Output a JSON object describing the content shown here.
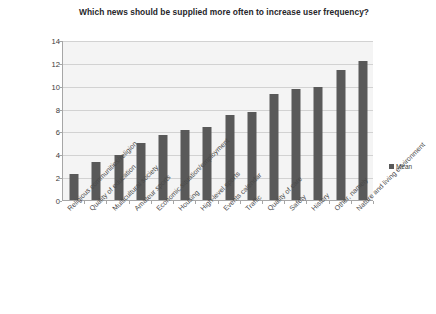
{
  "chart_data": {
    "type": "bar",
    "title": "Which news should be supplied more often to increase user frequency?",
    "xlabel": "",
    "ylabel": "",
    "ylim": [
      0,
      14
    ],
    "ytick_step": 2,
    "yticks": [
      0,
      2,
      4,
      6,
      8,
      10,
      12,
      14
    ],
    "grid": true,
    "legend_position": "right",
    "categories": [
      "Religious communities/religion",
      "Quality of education",
      "Multicultural society",
      "Amateur sports",
      "Economic situation/employment",
      "Housing",
      "High-level sports",
      "Events calendar",
      "Traffic",
      "Quality of care",
      "Safety",
      "History",
      "Other, namely",
      "Nature and living environment"
    ],
    "series": [
      {
        "name": "Mean",
        "color": "#595959",
        "values": [
          2.3,
          3.3,
          3.9,
          5.0,
          5.7,
          6.1,
          6.4,
          7.4,
          7.7,
          9.3,
          9.7,
          9.9,
          11.4,
          12.2
        ]
      }
    ]
  },
  "legend": {
    "entries": [
      {
        "label": "Mean",
        "color": "#595959",
        "marker": "square-marker"
      }
    ]
  },
  "colors": {
    "bar": "#595959",
    "plot_background": "#f4f4f4",
    "gridline": "#d2d2d2",
    "axis": "#a6a6a6",
    "title_text": "#26262a",
    "tick_text": "#3a3a3a",
    "page_background": "#ffffff"
  }
}
